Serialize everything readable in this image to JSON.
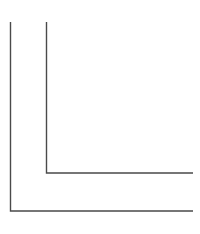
{
  "diagram": {
    "type": "nested-l-shapes",
    "stroke_color": "#4a4a4a",
    "background": "#ffffff",
    "shapes": [
      {
        "name": "outer-l-shape",
        "vertical_x": 10.5,
        "top_y": 22,
        "corner_y": 211,
        "right_x": 193
      },
      {
        "name": "inner-l-shape",
        "vertical_x": 46.5,
        "top_y": 22,
        "corner_y": 173,
        "right_x": 193
      }
    ]
  }
}
